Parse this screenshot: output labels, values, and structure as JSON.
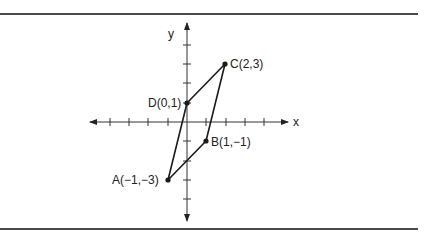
{
  "figure": {
    "axes": {
      "x_label": "x",
      "y_label": "y",
      "x_ticks": [
        -4,
        -3,
        -2,
        -1,
        1,
        2,
        3,
        4
      ],
      "y_ticks": [
        -5,
        -4,
        -3,
        -2,
        -1,
        1,
        2,
        3,
        4,
        5
      ],
      "arrows": "both ends"
    },
    "points": [
      {
        "name": "A",
        "x": -1,
        "y": -3,
        "label": "A(−1,−3)"
      },
      {
        "name": "B",
        "x": 1,
        "y": -1,
        "label": "B(1,−1)"
      },
      {
        "name": "C",
        "x": 2,
        "y": 3,
        "label": "C(2,3)"
      },
      {
        "name": "D",
        "x": 0,
        "y": 1,
        "label": "D(0,1)"
      }
    ],
    "polygon": [
      "A",
      "B",
      "C",
      "D"
    ],
    "shape": "parallelogram ABCD",
    "colors": {
      "ink": "#222222",
      "rule": "#4a4a4a",
      "background": "#ffffff"
    }
  }
}
